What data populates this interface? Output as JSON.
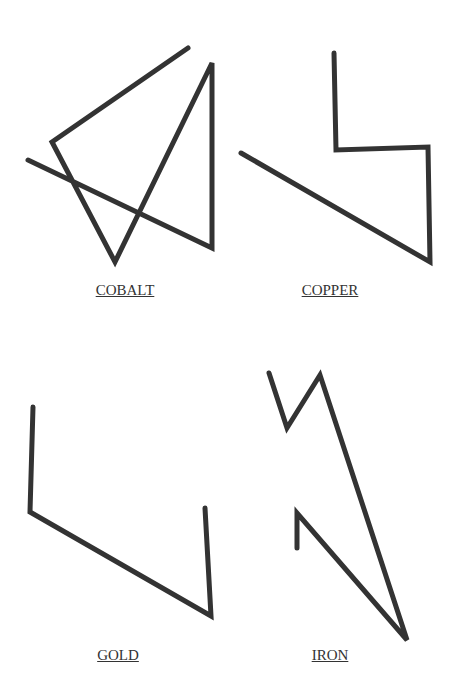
{
  "style": {
    "stroke_color": "#333333",
    "stroke_width": 5,
    "background": "#ffffff"
  },
  "figures": [
    {
      "name": "COBALT",
      "label": "COBALT",
      "label_pos": [
        125,
        282
      ],
      "points": [
        [
          188,
          48
        ],
        [
          52,
          142
        ],
        [
          115,
          262
        ],
        [
          212,
          63
        ],
        [
          212,
          248
        ],
        [
          28,
          160
        ]
      ]
    },
    {
      "name": "COPPER",
      "label": "COPPER",
      "label_pos": [
        330,
        282
      ],
      "points": [
        [
          334,
          53
        ],
        [
          336,
          150
        ],
        [
          428,
          147
        ],
        [
          430,
          262
        ],
        [
          241,
          153
        ]
      ]
    },
    {
      "name": "GOLD",
      "label": "GOLD",
      "label_pos": [
        118,
        647
      ],
      "points": [
        [
          33,
          407
        ],
        [
          30,
          512
        ],
        [
          211,
          616
        ],
        [
          205,
          508
        ]
      ]
    },
    {
      "name": "IRON",
      "label": "IRON",
      "label_pos": [
        330,
        647
      ],
      "points": [
        [
          269,
          373
        ],
        [
          287,
          428
        ],
        [
          320,
          375
        ],
        [
          407,
          640
        ],
        [
          297,
          513
        ],
        [
          297,
          548
        ]
      ]
    }
  ]
}
